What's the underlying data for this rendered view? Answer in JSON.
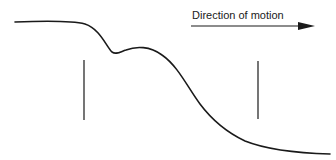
{
  "diagram": {
    "label": "Direction of motion",
    "colors": {
      "stroke": "#1a1a1a",
      "background": "#ffffff"
    },
    "elements": {
      "profile_curve": "surface-profile-curve",
      "left_marker": "vertical-marker-left",
      "right_marker": "vertical-marker-right",
      "arrow": "direction-arrow"
    }
  }
}
